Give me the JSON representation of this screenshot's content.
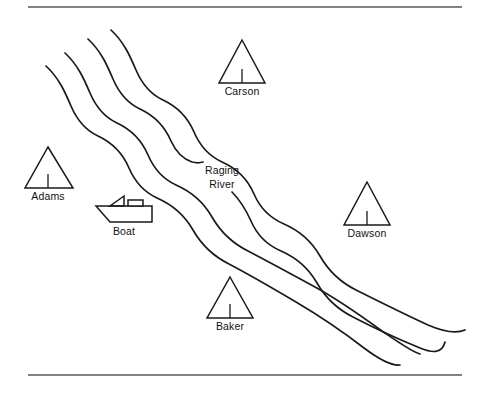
{
  "figure": {
    "kind": "map-diagram",
    "title_text": "",
    "background_color": "#ffffff",
    "ink_color": "#1a1a1a",
    "rule_color": "#575757",
    "width": 483,
    "height": 397
  },
  "rules": [
    {
      "name": "top-rule",
      "y": 7,
      "x1": 28,
      "x2": 462
    },
    {
      "name": "bottom-rule",
      "y": 375,
      "x1": 28,
      "x2": 462
    }
  ],
  "river": {
    "name": "Raging River",
    "label_line_1": "Raging",
    "label_line_2": "River",
    "label_x": 222,
    "label_y_1": 169,
    "label_y_2": 183,
    "bank_count": 4,
    "flow_direction": "northwest to southeast"
  },
  "markers": [
    {
      "id": "adams",
      "label": "Adams",
      "apex_x": 48,
      "apex_y": 147,
      "base_left_x": 25,
      "base_right_x": 73,
      "base_y": 188,
      "label_x": 48,
      "label_y": 196
    },
    {
      "id": "carson",
      "label": "Carson",
      "apex_x": 242,
      "apex_y": 40,
      "base_left_x": 219,
      "base_right_x": 265,
      "base_y": 83,
      "label_x": 242,
      "label_y": 91
    },
    {
      "id": "dawson",
      "label": "Dawson",
      "apex_x": 367,
      "apex_y": 182,
      "base_left_x": 344,
      "base_right_x": 390,
      "base_y": 225,
      "label_x": 367,
      "label_y": 233
    },
    {
      "id": "baker",
      "label": "Baker",
      "apex_x": 230,
      "apex_y": 277,
      "base_left_x": 207,
      "base_right_x": 253,
      "base_y": 318,
      "label_x": 230,
      "label_y": 326
    }
  ],
  "boat": {
    "id": "boat",
    "label": "Boat",
    "label_x": 124,
    "label_y": 231,
    "hull_left_x": 96,
    "hull_right_x": 152,
    "hull_top_y": 206,
    "hull_bottom_y": 222
  }
}
